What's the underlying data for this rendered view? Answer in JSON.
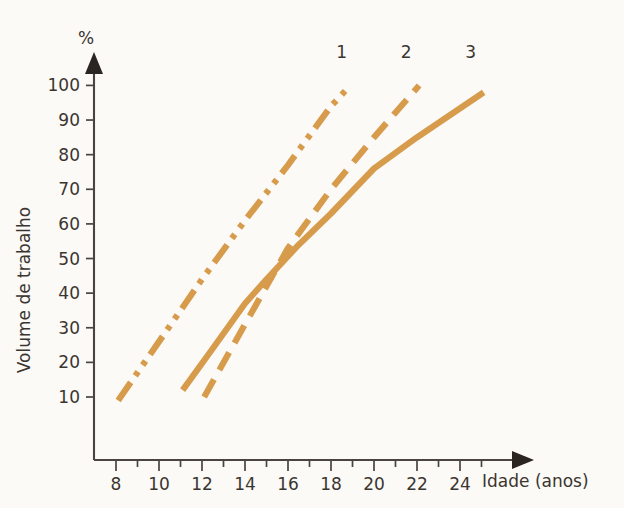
{
  "chart_data": {
    "type": "line",
    "title": "",
    "xlabel": "Idade (anos)",
    "ylabel": "Volume de trabalho",
    "yunit": "%",
    "xlim": [
      7,
      25.6
    ],
    "ylim": [
      4,
      104
    ],
    "grid": false,
    "legend_position": "line-end-top",
    "x_ticks_major": [
      8,
      10,
      12,
      14,
      16,
      18,
      20,
      22,
      24
    ],
    "x_ticks_minor": [
      9,
      11,
      13,
      15,
      17,
      19,
      21,
      23,
      25
    ],
    "x_tick_labels": [
      "8",
      "10",
      "12",
      "14",
      "16",
      "18",
      "20",
      "22",
      "24"
    ],
    "y_ticks": [
      10,
      20,
      30,
      40,
      50,
      60,
      70,
      80,
      90,
      100
    ],
    "y_tick_labels": [
      "10",
      "20",
      "30",
      "40",
      "50",
      "60",
      "70",
      "80",
      "90",
      "100"
    ],
    "series": [
      {
        "name": "1",
        "label": "1",
        "style": "dash-dot-dot",
        "color": "#d79b4c",
        "x": [
          8.1,
          10.0,
          12.0,
          14.0,
          16.0,
          18.0,
          18.9
        ],
        "y": [
          9,
          26,
          44,
          61,
          77,
          94,
          100
        ]
      },
      {
        "name": "2",
        "label": "2",
        "style": "dashed",
        "color": "#d79b4c",
        "x": [
          12.1,
          14.0,
          16.0,
          18.0,
          20.0,
          22.1
        ],
        "y": [
          10,
          31,
          53,
          70,
          85,
          100
        ]
      },
      {
        "name": "3",
        "label": "3",
        "style": "solid",
        "color": "#d79b4c",
        "x": [
          11.1,
          12.5,
          14.0,
          15.0,
          16.5,
          18.0,
          20.0,
          22.0,
          25.1
        ],
        "y": [
          12,
          24,
          37,
          44,
          54,
          63,
          76,
          85,
          98
        ]
      }
    ],
    "series_labels": [
      {
        "text": "1",
        "x": 18.5,
        "y": 108
      },
      {
        "text": "2",
        "x": 21.5,
        "y": 108
      },
      {
        "text": "3",
        "x": 24.5,
        "y": 108
      }
    ],
    "colors": {
      "curve": "#d79b4c",
      "axis": "#4a4440",
      "text": "#3b3530",
      "background": "#fbfaf7"
    }
  },
  "axes": {
    "y_unit_label": "%",
    "y_title": "Volume de trabalho",
    "x_title": "Idade (anos)"
  }
}
